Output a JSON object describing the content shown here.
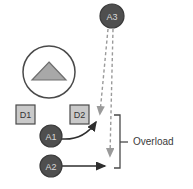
{
  "diagram": {
    "background": "#ffffff",
    "colors": {
      "node_fill": "#4f4f4f",
      "node_stroke": "#3a3a3a",
      "node_text": "#d9d9d9",
      "box_fill": "#c9c9c9",
      "box_stroke": "#4a4a4a",
      "box_text": "#333333",
      "triangle_fill": "#a8a8a8",
      "triangle_stroke": "#6e6e6e",
      "circle_stroke": "#4a4a4a",
      "solid_arrow": "#2e2e2e",
      "dashed_arrow": "#9a9a9a",
      "bracket": "#4a4a4a",
      "annotation_text": "#3b3b3b"
    },
    "nodes": [
      {
        "id": "A3",
        "label": "A3",
        "shape": "circle",
        "cx": 112,
        "cy": 16,
        "r": 12
      },
      {
        "id": "A1",
        "label": "A1",
        "shape": "circle",
        "cx": 51,
        "cy": 136,
        "r": 11
      },
      {
        "id": "A2",
        "label": "A2",
        "shape": "circle",
        "cx": 51,
        "cy": 166,
        "r": 11
      }
    ],
    "boxes": [
      {
        "id": "D1",
        "label": "D1",
        "x": 16,
        "y": 105,
        "w": 19,
        "h": 19
      },
      {
        "id": "D2",
        "label": "D2",
        "x": 70,
        "y": 105,
        "w": 19,
        "h": 19
      }
    ],
    "sensor": {
      "id": "sensor",
      "label": "",
      "cx": 49,
      "cy": 72,
      "r": 26,
      "glyph": "triangle-up"
    },
    "arrows": [
      {
        "id": "a1-to-d2",
        "style": "solid",
        "from": "A1",
        "to": "overload-top"
      },
      {
        "id": "a2-to-bracket",
        "style": "solid",
        "from": "A2",
        "to": "overload-bottom"
      },
      {
        "id": "a3-to-upper",
        "style": "dashed",
        "from": "A3",
        "to": "overload-top"
      },
      {
        "id": "a3-to-lower",
        "style": "dashed",
        "from": "A3",
        "to": "overload-bottom"
      }
    ],
    "annotation": {
      "id": "overload-bracket",
      "label": "Overload",
      "bracket_x": 120,
      "bracket_top": 115,
      "bracket_bottom": 168,
      "label_x": 141,
      "label_y": 145
    }
  }
}
